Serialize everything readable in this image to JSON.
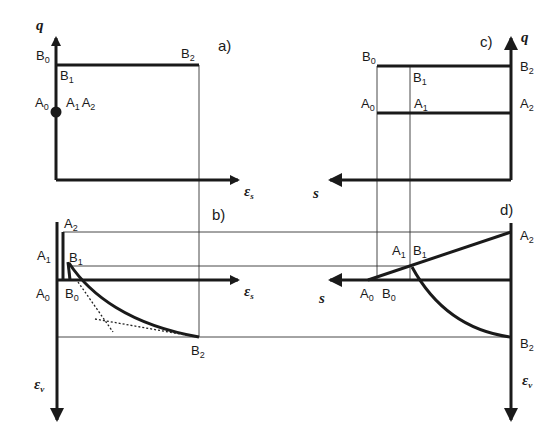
{
  "figure": {
    "panels": [
      {
        "id": "a",
        "label": "a)",
        "x_axis": "ε_s",
        "y_axis": "q"
      },
      {
        "id": "b",
        "label": "b)",
        "x_axis": "ε_s",
        "y_axis": "ε_v"
      },
      {
        "id": "c",
        "label": "c)",
        "x_axis": "s",
        "y_axis": "q"
      },
      {
        "id": "d",
        "label": "d)",
        "x_axis": "s",
        "y_axis": "ε_v"
      }
    ],
    "axis_symbols": {
      "q": "q",
      "eps": "ε",
      "s_sub": "s",
      "v_sub": "v",
      "s": "s"
    },
    "points": {
      "A": "A",
      "B": "B",
      "sub0": "0",
      "sub1": "1",
      "sub2": "2"
    }
  }
}
